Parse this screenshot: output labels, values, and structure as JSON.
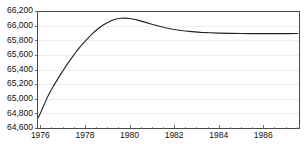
{
  "chart_data": {
    "type": "line",
    "title": "",
    "subtitle": "",
    "xlabel": "",
    "ylabel": "",
    "xlim": [
      1975.85,
      1987.6
    ],
    "ylim": [
      64600,
      66200
    ],
    "grid": true,
    "legend": null,
    "x_tick_labels": [
      "1976",
      "1978",
      "1980",
      "1982",
      "1984",
      "1986"
    ],
    "x_tick_values": [
      1976,
      1978,
      1980,
      1982,
      1984,
      1986
    ],
    "x_minor_tick_values": [
      1976.5,
      1977,
      1977.5,
      1978.5,
      1979,
      1979.5,
      1980.5,
      1981,
      1981.5,
      1982.5,
      1983,
      1983.5,
      1984.5,
      1985,
      1985.5,
      1986.5,
      1987,
      1987.5
    ],
    "y_tick_labels": [
      "66,200",
      "66,000",
      "65,800",
      "65,600",
      "65,400",
      "65,200",
      "65,000",
      "64,800",
      "64,600"
    ],
    "y_tick_values": [
      66200,
      66000,
      65800,
      65600,
      65400,
      65200,
      65000,
      64800,
      64600
    ],
    "series": [
      {
        "name": "population",
        "color": "#222222",
        "x": [
          1975.9,
          1976.0,
          1976.1,
          1976.2,
          1976.3,
          1976.45,
          1976.6,
          1976.75,
          1976.9,
          1977.05,
          1977.2,
          1977.4,
          1977.6,
          1977.8,
          1978.0,
          1978.2,
          1978.4,
          1978.6,
          1978.8,
          1979.0,
          1979.2,
          1979.4,
          1979.6,
          1979.8,
          1980.0,
          1980.2,
          1980.4,
          1980.6,
          1980.8,
          1981.0,
          1981.3,
          1981.6,
          1982.0,
          1982.4,
          1982.8,
          1983.2,
          1983.6,
          1984.0,
          1984.5,
          1985.0,
          1985.5,
          1986.0,
          1986.5,
          1987.0,
          1987.55
        ],
        "y": [
          64740,
          64800,
          64870,
          64940,
          65010,
          65100,
          65180,
          65255,
          65330,
          65400,
          65470,
          65555,
          65640,
          65715,
          65785,
          65850,
          65910,
          65960,
          66005,
          66040,
          66070,
          66090,
          66100,
          66103,
          66098,
          66088,
          66072,
          66055,
          66038,
          66020,
          65995,
          65972,
          65948,
          65930,
          65918,
          65908,
          65902,
          65898,
          65894,
          65892,
          65891,
          65890,
          65890,
          65891,
          65893
        ]
      }
    ]
  },
  "plot_geometry": {
    "left": 37,
    "right": 299,
    "top": 11,
    "bottom": 128
  }
}
